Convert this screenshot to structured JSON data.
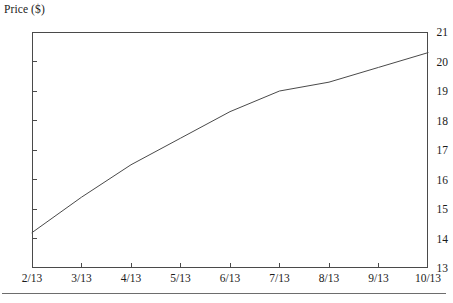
{
  "chart_data": {
    "type": "line",
    "title": "",
    "subtitle": "",
    "xlabel": "",
    "ylabel": "Price ($)",
    "grid": false,
    "legend": false,
    "legend_position": "none",
    "line_color": "#4a4a4a",
    "frame_color": "#4a4a4a",
    "x": [
      "2/13",
      "3/13",
      "4/13",
      "5/13",
      "6/13",
      "7/13",
      "8/13",
      "9/13",
      "10/13"
    ],
    "xtick_labels": [
      "2/13",
      "3/13",
      "4/13",
      "5/13",
      "6/13",
      "7/13",
      "8/13",
      "9/13",
      "10/13"
    ],
    "ytick_labels": [
      "13",
      "14",
      "15",
      "16",
      "17",
      "18",
      "19",
      "20",
      "21"
    ],
    "ytick_values": [
      13,
      14,
      15,
      16,
      17,
      18,
      19,
      20,
      21
    ],
    "xlim": [
      0,
      8
    ],
    "ylim": [
      13,
      21
    ],
    "series": [
      {
        "name": "Price",
        "values": [
          14.2,
          15.4,
          16.5,
          17.4,
          18.3,
          19.0,
          19.3,
          19.8,
          20.3
        ]
      }
    ]
  }
}
